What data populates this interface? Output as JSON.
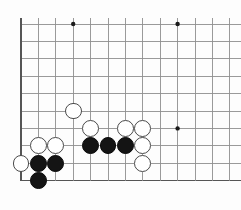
{
  "document": {
    "type": "go-board-diagram",
    "caption": ""
  },
  "board": {
    "origin_x": 21,
    "origin_y": 24,
    "spacing": 17.4,
    "cols": 13,
    "rows": 10,
    "edges": {
      "left": true,
      "bottom": true,
      "top": false,
      "right": false
    },
    "line_color": "#8f8f8f",
    "edge_color": "#555555",
    "background": "#fdfdfd",
    "stone_radius": 8.4,
    "star_point_color": "#1a1a1a",
    "star_point_radius": 2.2,
    "star_points": [
      {
        "col": 3,
        "row": 0
      },
      {
        "col": 9,
        "row": 0
      },
      {
        "col": 9,
        "row": 6
      }
    ],
    "stones": [
      {
        "color": "white",
        "col": 3,
        "row": 5
      },
      {
        "color": "white",
        "col": 4,
        "row": 6
      },
      {
        "color": "white",
        "col": 6,
        "row": 6
      },
      {
        "color": "white",
        "col": 7,
        "row": 6
      },
      {
        "color": "white",
        "col": 1,
        "row": 7
      },
      {
        "color": "white",
        "col": 2,
        "row": 7
      },
      {
        "color": "white",
        "col": 7,
        "row": 7
      },
      {
        "color": "white",
        "col": 0,
        "row": 8
      },
      {
        "color": "white",
        "col": 7,
        "row": 8
      },
      {
        "color": "black",
        "col": 4,
        "row": 7
      },
      {
        "color": "black",
        "col": 5,
        "row": 7
      },
      {
        "color": "black",
        "col": 6,
        "row": 7
      },
      {
        "color": "black",
        "col": 1,
        "row": 8
      },
      {
        "color": "black",
        "col": 2,
        "row": 8
      },
      {
        "color": "black",
        "col": 1,
        "row": 9
      }
    ]
  }
}
